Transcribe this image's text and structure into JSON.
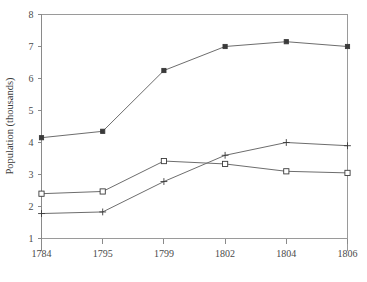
{
  "chart_data": {
    "type": "line",
    "title": "",
    "xlabel": "",
    "ylabel": "Population (thousands)",
    "categories": [
      "1784",
      "1795",
      "1799",
      "1802",
      "1804",
      "1806"
    ],
    "ylim": [
      1,
      8
    ],
    "yticks": [
      "1",
      "2",
      "3",
      "4",
      "5",
      "6",
      "7",
      "8"
    ],
    "ytick_values": [
      1,
      2,
      3,
      4,
      5,
      6,
      7,
      8
    ],
    "grid": false,
    "legend": "none",
    "series": [
      {
        "name": "series-1",
        "marker": "dot",
        "values": [
          4.15,
          4.35,
          6.25,
          7.0,
          7.15,
          7.0
        ]
      },
      {
        "name": "series-2",
        "marker": "square",
        "values": [
          2.4,
          2.47,
          3.42,
          3.33,
          3.1,
          3.05
        ]
      },
      {
        "name": "series-3",
        "marker": "plus",
        "values": [
          1.78,
          1.83,
          2.78,
          3.6,
          4.0,
          3.9
        ]
      }
    ]
  },
  "axes": {
    "y_title": "Population (thousands)"
  }
}
